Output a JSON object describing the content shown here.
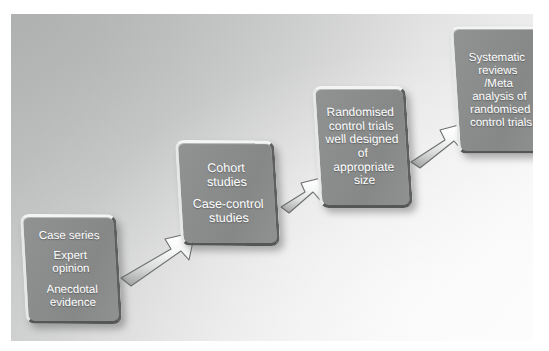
{
  "figure": {
    "kind": "hierarchy-of-evidence-flow-diagram",
    "orientation": "ascending left-to-right",
    "canvas_background": "#cfd0d0",
    "node_fill": "#8b8d8d",
    "node_text_color": "#ffffff",
    "arrow_fill": "#e9eaea",
    "arrow_outline": "#6f7171"
  },
  "nodes": [
    {
      "id": "node-1",
      "name": "case-series-node",
      "lines": [
        "Case series",
        "",
        "Expert",
        "opinion",
        "",
        "Anecdotal",
        "evidence"
      ]
    },
    {
      "id": "node-2",
      "name": "cohort-studies-node",
      "lines": [
        "Cohort",
        "studies",
        "",
        "Case-control",
        "studies"
      ]
    },
    {
      "id": "node-3",
      "name": "randomised-control-trials-node",
      "lines": [
        "Randomised",
        "control trials",
        "well designed",
        "of",
        "appropriate",
        "size"
      ]
    },
    {
      "id": "node-4",
      "name": "systematic-reviews-node",
      "lines": [
        "Systematic",
        "reviews",
        "/Meta",
        "analysis of",
        "randomised",
        "control trials"
      ]
    }
  ],
  "arrows": [
    {
      "id": "arrow-1",
      "name": "arrow-case-series-to-cohort",
      "from": "node-1",
      "to": "node-2",
      "direction": "up-right"
    },
    {
      "id": "arrow-2",
      "name": "arrow-cohort-to-rct",
      "from": "node-2",
      "to": "node-3",
      "direction": "up-right"
    },
    {
      "id": "arrow-3",
      "name": "arrow-rct-to-systematic-reviews",
      "from": "node-3",
      "to": "node-4",
      "direction": "up-right"
    }
  ]
}
